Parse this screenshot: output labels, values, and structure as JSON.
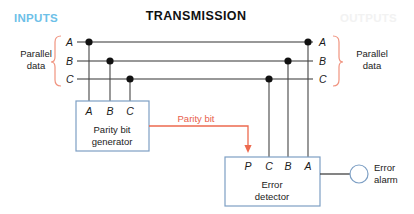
{
  "figure": {
    "title": "TRANSMISSION",
    "inputs_label": "INPUTS",
    "outputs_label": "OUTPUTS",
    "left_group_label_line1": "Parallel",
    "left_group_label_line2": "data",
    "right_group_label_line1": "Parallel",
    "right_group_label_line2": "data"
  },
  "bus": {
    "left_letters": [
      "A",
      "B",
      "C"
    ],
    "right_letters": [
      "A",
      "B",
      "C"
    ]
  },
  "generator": {
    "pins": [
      "A",
      "B",
      "C"
    ],
    "title_line1": "Parity bit",
    "title_line2": "generator"
  },
  "detector": {
    "pins": [
      "P",
      "C",
      "B",
      "A"
    ],
    "title_line1": "Error",
    "title_line2": "detector"
  },
  "parity": {
    "signal_label": "Parity bit"
  },
  "alarm": {
    "label_line1": "Error",
    "label_line2": "alarm"
  },
  "colors": {
    "inputs": "#6cc0e8",
    "outputs": "#f2f2f2",
    "parity": "#ed6a4f",
    "brace": "#f0937f",
    "box_border": "#7d9fc4",
    "wire": "#333333",
    "background": "#ffffff"
  }
}
